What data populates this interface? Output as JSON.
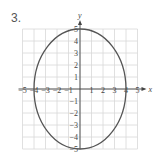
{
  "problem_number": "3.",
  "chart_data": {
    "type": "line",
    "title": "",
    "xlabel": "x",
    "ylabel": "y",
    "xlim": [
      -5,
      5
    ],
    "ylim": [
      -5,
      5
    ],
    "grid": true,
    "x_ticks": [
      "-5",
      "-4",
      "-3",
      "-2",
      "-1",
      "1",
      "2",
      "3",
      "4",
      "5"
    ],
    "y_ticks": [
      "5",
      "4",
      "3",
      "2",
      "1",
      "-1",
      "-2",
      "-3",
      "-4",
      "-5"
    ],
    "series": [
      {
        "name": "ellipse",
        "shape": "ellipse",
        "center": [
          0,
          0
        ],
        "semi_x": 4,
        "semi_y": 5
      }
    ]
  }
}
